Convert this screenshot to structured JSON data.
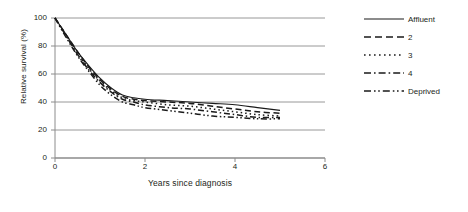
{
  "chart_data": {
    "type": "line",
    "title": "",
    "xlabel": "Years since diagnosis",
    "ylabel": "Relative survival (%)",
    "xlim": [
      0,
      6
    ],
    "ylim": [
      0,
      100
    ],
    "xticks": [
      0,
      2,
      4,
      6
    ],
    "yticks": [
      0,
      20,
      40,
      60,
      80,
      100
    ],
    "grid": "horizontal",
    "legend_position": "right",
    "x": [
      0,
      0.25,
      0.5,
      0.75,
      1,
      1.25,
      1.5,
      1.75,
      2,
      2.5,
      3,
      3.5,
      4,
      4.5,
      5
    ],
    "series": [
      {
        "name": "Affluent",
        "dash": "solid",
        "values": [
          100,
          88,
          76,
          66,
          57,
          50,
          45,
          43,
          42,
          41,
          40,
          39,
          38,
          36,
          34
        ]
      },
      {
        "name": "2",
        "dash": "dashed",
        "values": [
          100,
          88,
          76,
          65,
          56,
          49,
          44,
          42,
          41,
          40,
          39,
          37,
          35,
          33,
          32
        ]
      },
      {
        "name": "3",
        "dash": "dotted",
        "values": [
          100,
          87,
          75,
          64,
          55,
          48,
          43,
          41,
          40,
          38,
          37,
          35,
          33,
          31,
          30
        ]
      },
      {
        "name": "4",
        "dash": "dashdot",
        "values": [
          100,
          87,
          74,
          63,
          54,
          47,
          42,
          40,
          38,
          36,
          35,
          33,
          31,
          29,
          29
        ]
      },
      {
        "name": "Deprived",
        "dash": "dashdotdot",
        "values": [
          100,
          86,
          73,
          62,
          52,
          45,
          40,
          38,
          36,
          34,
          32,
          30,
          29,
          28,
          28
        ]
      }
    ]
  },
  "legend": {
    "items": [
      {
        "label": "Affluent",
        "dash": "solid"
      },
      {
        "label": "2",
        "dash": "dashed"
      },
      {
        "label": "3",
        "dash": "dotted"
      },
      {
        "label": "4",
        "dash": "dashdot"
      },
      {
        "label": "Deprived",
        "dash": "dashdotdot"
      }
    ]
  },
  "axes": {
    "y_title": "Relative survival (%)",
    "x_title": "Years since diagnosis",
    "y_tick_labels": [
      "100",
      "80",
      "60",
      "40",
      "20",
      "0"
    ],
    "x_tick_labels": [
      "0",
      "2",
      "4",
      "6"
    ]
  },
  "colors": {
    "line": "#1a1a1a",
    "grid": "#8c8c8c",
    "axis": "#8c8c8c",
    "text": "#231f20",
    "background": "#ffffff"
  }
}
